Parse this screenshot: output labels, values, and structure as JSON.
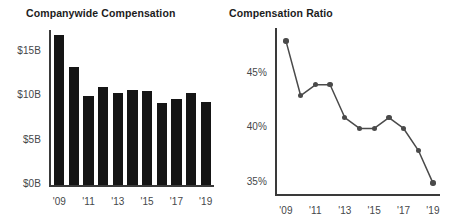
{
  "chart_data": [
    {
      "type": "bar",
      "title": "Companywide Compensation",
      "xlabel": "",
      "ylabel": "",
      "categories": [
        "'09",
        "'10",
        "'11",
        "'12",
        "'13",
        "'14",
        "'15",
        "'16",
        "'17",
        "'18",
        "'19"
      ],
      "values": [
        16.9,
        13.3,
        10.1,
        11.1,
        10.4,
        10.7,
        10.6,
        9.3,
        9.7,
        10.4,
        9.4
      ],
      "ylim": [
        0,
        17.5
      ],
      "yticks": [
        0,
        5,
        10,
        15
      ],
      "ytick_labels": [
        "$0B",
        "$5B",
        "$10B",
        "$15B"
      ],
      "xtick_labels": [
        "'09",
        "'11",
        "'13",
        "'15",
        "'17",
        "'19"
      ],
      "xtick_indices": [
        0,
        2,
        4,
        6,
        8,
        10
      ],
      "grid": false,
      "legend": "none",
      "bar_color": "#151515"
    },
    {
      "type": "line",
      "title": "Compensation Ratio",
      "xlabel": "",
      "ylabel": "",
      "categories": [
        "'09",
        "'10",
        "'11",
        "'12",
        "'13",
        "'14",
        "'15",
        "'16",
        "'17",
        "'18",
        "'19"
      ],
      "values": [
        48.0,
        43.0,
        44.0,
        44.0,
        41.0,
        40.0,
        40.0,
        41.0,
        40.0,
        38.0,
        35.0
      ],
      "ylim": [
        34.0,
        49.2
      ],
      "yticks": [
        35,
        40,
        45
      ],
      "ytick_labels": [
        "35%",
        "40%",
        "45%"
      ],
      "xtick_labels": [
        "'09",
        "'11",
        "'13",
        "'15",
        "'17",
        "'19"
      ],
      "xtick_indices": [
        0,
        2,
        4,
        6,
        8,
        10
      ],
      "grid": false,
      "legend": "none",
      "line_color": "#4a4a4a",
      "marker_color": "#4a4a4a"
    }
  ],
  "left_panel": {
    "title": "Companywide Compensation"
  },
  "right_panel": {
    "title": "Compensation Ratio"
  }
}
